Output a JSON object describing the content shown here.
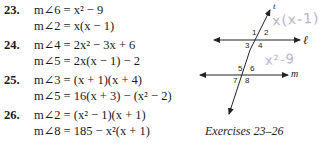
{
  "exercises": [
    {
      "number": "23.",
      "lines": [
        "m∠6 = x² − 9",
        "m∠2 = x(x − 1)"
      ]
    },
    {
      "number": "24.",
      "lines": [
        "m∠4 = 2x² − 3x + 6",
        "m∠5 = 2x(x − 1) − 2"
      ]
    },
    {
      "number": "25.",
      "lines": [
        "m∠3 = (x + 1)(x + 4)",
        "m∠5 = 16(x + 3) − (x² − 2)"
      ]
    },
    {
      "number": "26.",
      "lines": [
        "m∠2 = (x² − 1)(x + 1)",
        "m∠8 = 185 − x²(x + 1)"
      ]
    }
  ],
  "figure": {
    "transversal_label": "t",
    "line_l_label": "ℓ",
    "line_m_label": "m",
    "angle_labels": [
      "1",
      "2",
      "3",
      "4",
      "5",
      "6",
      "7",
      "8"
    ],
    "handwritten_notes": [
      "x(x-1)",
      "x²-9"
    ],
    "caption": "Exercises 23–26"
  }
}
